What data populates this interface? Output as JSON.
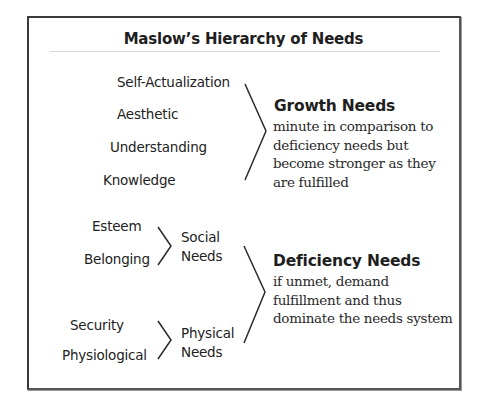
{
  "title": "Maslow’s Hierarchy of Needs",
  "growth": {
    "items": [
      "Self-Actualization",
      "Aesthetic",
      "Understanding",
      "Knowledge"
    ],
    "heading": "Growth Needs",
    "description": "minute in comparison to deficiency needs but become stronger as they are fulfilled"
  },
  "deficiency": {
    "social": {
      "items": [
        "Esteem",
        "Belonging"
      ],
      "label_line1": "Social",
      "label_line2": "Needs"
    },
    "physical": {
      "items": [
        "Security",
        "Physiological"
      ],
      "label_line1": "Physical",
      "label_line2": "Needs"
    },
    "heading": "Deficiency Needs",
    "description": "if unmet, demand fulfillment and thus dominate the needs system"
  },
  "colors": {
    "text": "#222222",
    "border": "#3a3a3a",
    "divider": "#d8d8d8"
  },
  "icons": {
    "growth_bracket": "chevron-right-bracket",
    "social_bracket": "chevron-right-bracket",
    "physical_bracket": "chevron-right-bracket",
    "deficiency_bracket": "chevron-right-bracket"
  }
}
